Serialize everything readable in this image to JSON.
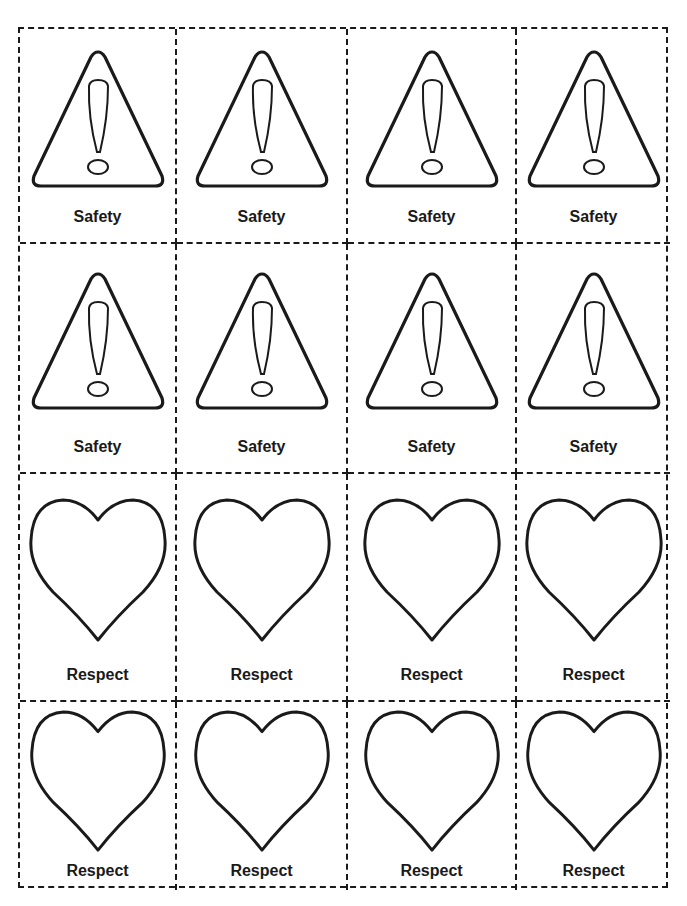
{
  "worksheet": {
    "layout": {
      "columns": 4,
      "rows": 4
    },
    "line_color": "#1a1a1a",
    "cards": [
      {
        "label": "Safety",
        "icon": "warning-triangle-icon"
      },
      {
        "label": "Safety",
        "icon": "warning-triangle-icon"
      },
      {
        "label": "Safety",
        "icon": "warning-triangle-icon"
      },
      {
        "label": "Safety",
        "icon": "warning-triangle-icon"
      },
      {
        "label": "Safety",
        "icon": "warning-triangle-icon"
      },
      {
        "label": "Safety",
        "icon": "warning-triangle-icon"
      },
      {
        "label": "Safety",
        "icon": "warning-triangle-icon"
      },
      {
        "label": "Safety",
        "icon": "warning-triangle-icon"
      },
      {
        "label": "Respect",
        "icon": "heart-icon"
      },
      {
        "label": "Respect",
        "icon": "heart-icon"
      },
      {
        "label": "Respect",
        "icon": "heart-icon"
      },
      {
        "label": "Respect",
        "icon": "heart-icon"
      },
      {
        "label": "Respect",
        "icon": "heart-icon"
      },
      {
        "label": "Respect",
        "icon": "heart-icon"
      },
      {
        "label": "Respect",
        "icon": "heart-icon"
      },
      {
        "label": "Respect",
        "icon": "heart-icon"
      }
    ]
  }
}
